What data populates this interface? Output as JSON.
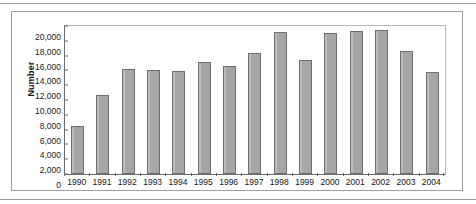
{
  "figure": {
    "y_axis_title": "Number"
  },
  "chart_data": {
    "type": "bar",
    "title": "",
    "xlabel": "",
    "ylabel": "Number",
    "ylim": [
      0,
      20000
    ],
    "ytick_step": 2000,
    "yticks": [
      20000,
      18000,
      16000,
      14000,
      12000,
      10000,
      8000,
      6000,
      4000,
      2000,
      0
    ],
    "ytick_labels": [
      "20,000",
      "18,000",
      "16,000",
      "14,000",
      "12,000",
      "10,000",
      "8,000",
      "6,000",
      "4,000",
      "2,000",
      "0"
    ],
    "grid": false,
    "legend": null,
    "bar_color": "#a9a9a9",
    "bar_edge_color": "#6d6d6d",
    "categories": [
      "1990",
      "1991",
      "1992",
      "1993",
      "1994",
      "1995",
      "1996",
      "1997",
      "1998",
      "1999",
      "2000",
      "2001",
      "2002",
      "2003",
      "2004"
    ],
    "values": [
      6500,
      10700,
      14200,
      14050,
      13950,
      15100,
      14550,
      16350,
      19200,
      15450,
      19100,
      19350,
      19400,
      16600,
      13800
    ]
  }
}
